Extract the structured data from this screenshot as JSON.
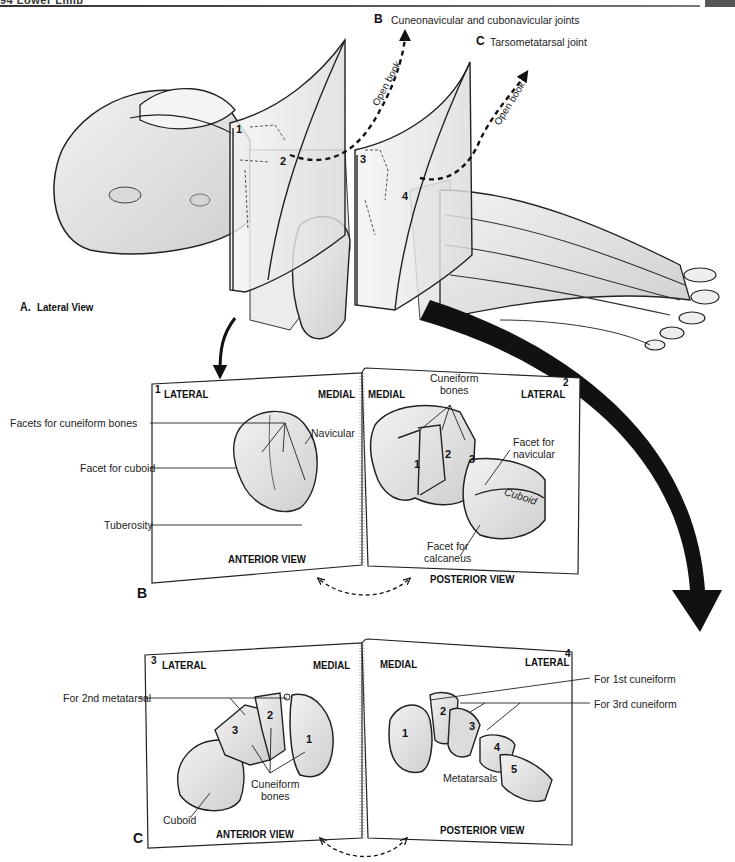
{
  "header": {
    "page_label": "94 Lower Limb"
  },
  "panel_a": {
    "letter": "A.",
    "caption": "Lateral View",
    "planes": [
      {
        "number": "1"
      },
      {
        "number": "2"
      },
      {
        "number": "3"
      },
      {
        "number": "4"
      }
    ],
    "callout_b": {
      "letter": "B",
      "text": "Cuneonavicular and cubonavicular joints",
      "arrow_label": "Open book"
    },
    "callout_c": {
      "letter": "C",
      "text": "Tarsometatarsal joint",
      "arrow_label": "Open book"
    }
  },
  "panel_b": {
    "letter": "B",
    "left_page": {
      "number": "1",
      "side_left": "LATERAL",
      "side_right": "MEDIAL",
      "view": "ANTERIOR VIEW",
      "bone_label": "Navicular",
      "callouts": [
        "Facets for cuneiform bones",
        "Facet for cuboid",
        "Tuberosity"
      ]
    },
    "right_page": {
      "number": "2",
      "side_left": "MEDIAL",
      "side_right": "LATERAL",
      "view": "POSTERIOR VIEW",
      "group_label_line1": "Cuneiform",
      "group_label_line2": "bones",
      "bone_numbers": [
        "1",
        "2",
        "3"
      ],
      "facet_nav_line1": "Facet for",
      "facet_nav_line2": "navicular",
      "cuboid_label": "Cuboid",
      "facet_calc_line1": "Facet for",
      "facet_calc_line2": "calcaneus"
    }
  },
  "panel_c": {
    "letter": "C",
    "left_page": {
      "number": "3",
      "side_left": "LATERAL",
      "side_right": "MEDIAL",
      "view": "ANTERIOR VIEW",
      "callout": "For 2nd metatarsal",
      "bone_numbers": [
        "3",
        "2",
        "1"
      ],
      "group_label_line1": "Cuneiform",
      "group_label_line2": "bones",
      "cuboid_label": "Cuboid"
    },
    "right_page": {
      "number": "4",
      "side_left": "MEDIAL",
      "side_right": "LATERAL",
      "view": "POSTERIOR VIEW",
      "callouts": [
        "For 1st cuneiform",
        "For 3rd cuneiform"
      ],
      "bone_numbers": [
        "1",
        "2",
        "3",
        "4",
        "5"
      ],
      "group_label": "Metatarsals"
    }
  },
  "colors": {
    "ink": "#1a1a1a",
    "bone_fill": "#e6e6e6",
    "bone_shade": "#cfcfcf",
    "page_fill": "#ffffff",
    "header_bar": "#555555"
  }
}
